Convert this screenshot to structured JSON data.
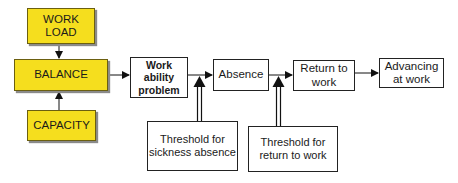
{
  "diagram": {
    "nodes": {
      "work_load": {
        "label": "WORK\nLOAD",
        "line1": "WORK",
        "line2": "LOAD",
        "fill": "#F5DE1E"
      },
      "balance": {
        "label": "BALANCE",
        "fill": "#F5DE1E"
      },
      "capacity": {
        "label": "CAPACITY",
        "fill": "#F5DE1E"
      },
      "work_ability_problem": {
        "line1": "Work ability",
        "line2": "problem"
      },
      "absence": {
        "label": "Absence"
      },
      "return_to_work": {
        "line1": "Return to",
        "line2": "work"
      },
      "advancing_at_work": {
        "line1": "Advancing",
        "line2": "at work"
      },
      "threshold_sickness": {
        "line1": "Threshold for",
        "line2": "sickness absence"
      },
      "threshold_return": {
        "line1": "Threshold for",
        "line2": "return to work"
      }
    },
    "edges": [
      {
        "from": "work_load",
        "to": "balance"
      },
      {
        "from": "capacity",
        "to": "balance"
      },
      {
        "from": "balance",
        "to": "work_ability_problem"
      },
      {
        "from": "work_ability_problem",
        "to": "absence"
      },
      {
        "from": "threshold_sickness",
        "to": "work_ability_problem->absence"
      },
      {
        "from": "absence",
        "to": "return_to_work"
      },
      {
        "from": "threshold_return",
        "to": "absence->return_to_work"
      },
      {
        "from": "return_to_work",
        "to": "advancing_at_work"
      }
    ]
  }
}
